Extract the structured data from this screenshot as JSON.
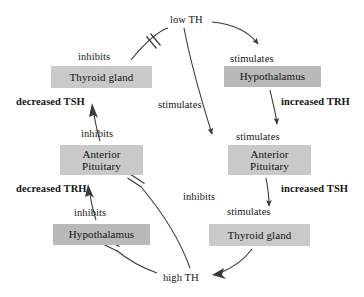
{
  "diagram": {
    "colors": {
      "box_fill_light": "#c9c9c9",
      "box_fill_dark": "#b9b9b9",
      "stroke": "#3a3a3a",
      "text": "#151515",
      "background": "#ffffff"
    },
    "hormone_states": [
      {
        "id": "low-th",
        "label": "low TH",
        "x": 170,
        "y": 14
      },
      {
        "id": "high-th",
        "label": "high TH",
        "x": 163,
        "y": 272
      }
    ],
    "nodes": [
      {
        "id": "thyroid-gland-left",
        "label": "Thyroid gland",
        "x": 51,
        "y": 66,
        "w": 101,
        "h": 22,
        "shade": "light"
      },
      {
        "id": "hypothalamus-right",
        "label": "Hypothalamus",
        "x": 224,
        "y": 66,
        "w": 97,
        "h": 21,
        "shade": "dark"
      },
      {
        "id": "anterior-pituitary-left",
        "label": "Anterior\nPituitary",
        "x": 60,
        "y": 145,
        "w": 83,
        "h": 30,
        "shade": "light"
      },
      {
        "id": "anterior-pituitary-right",
        "label": "Anterior\nPituitary",
        "x": 228,
        "y": 145,
        "w": 83,
        "h": 30,
        "shade": "light"
      },
      {
        "id": "hypothalamus-bottom",
        "label": "Hypothalamus",
        "x": 53,
        "y": 224,
        "w": 97,
        "h": 21,
        "shade": "dark"
      },
      {
        "id": "thyroid-gland-right",
        "label": "Thyroid gland",
        "x": 209,
        "y": 224,
        "w": 101,
        "h": 22,
        "shade": "light"
      }
    ],
    "edge_labels": [
      {
        "id": "inhibits-low-th-thyroid",
        "label": "inhibits",
        "x": 78,
        "y": 51
      },
      {
        "id": "stimulates-low-th-hypothalamus",
        "label": "stimulates",
        "x": 230,
        "y": 53
      },
      {
        "id": "decreased-tsh",
        "label": "decreased TSH",
        "x": 16,
        "y": 96,
        "bold": true
      },
      {
        "id": "increased-trh",
        "label": "increased TRH",
        "x": 281,
        "y": 96,
        "bold": true
      },
      {
        "id": "stimulates-low-th-pituitary",
        "label": "stimulates",
        "x": 158,
        "y": 99
      },
      {
        "id": "stimulates-trh-pituitary",
        "label": "stimulates",
        "x": 236,
        "y": 131
      },
      {
        "id": "inhibits-pituitary-thyroid",
        "label": "inhibits",
        "x": 81,
        "y": 128
      },
      {
        "id": "decreased-trh",
        "label": "decreased TRH",
        "x": 16,
        "y": 183,
        "bold": true
      },
      {
        "id": "increased-tsh",
        "label": "increased TSH",
        "x": 281,
        "y": 183,
        "bold": true
      },
      {
        "id": "inhibits-high-th-pituitary",
        "label": "inhibits",
        "x": 183,
        "y": 191
      },
      {
        "id": "inhibits-hypothalamus-pituitary",
        "label": "inhibits",
        "x": 74,
        "y": 207
      },
      {
        "id": "stimulates-tsh-thyroid",
        "label": "stimulates",
        "x": 227,
        "y": 206
      }
    ],
    "relations": [
      {
        "from": "low TH",
        "to": "Thyroid gland",
        "type": "inhibits"
      },
      {
        "from": "low TH",
        "to": "Hypothalamus",
        "type": "stimulates"
      },
      {
        "from": "low TH",
        "to": "Anterior Pituitary",
        "type": "stimulates"
      },
      {
        "from": "Hypothalamus",
        "to": "Anterior Pituitary",
        "type": "stimulates",
        "signal": "increased TRH"
      },
      {
        "from": "Anterior Pituitary",
        "to": "Thyroid gland",
        "type": "stimulates",
        "signal": "increased TSH"
      },
      {
        "from": "Thyroid gland",
        "to": "high TH",
        "type": "produces"
      },
      {
        "from": "high TH",
        "to": "Anterior Pituitary",
        "type": "inhibits"
      },
      {
        "from": "high TH",
        "to": "Hypothalamus",
        "type": "inhibits"
      },
      {
        "from": "Hypothalamus",
        "to": "Anterior Pituitary",
        "type": "inhibits",
        "signal": "decreased TRH"
      },
      {
        "from": "Anterior Pituitary",
        "to": "Thyroid gland",
        "type": "inhibits",
        "signal": "decreased TSH"
      }
    ]
  }
}
